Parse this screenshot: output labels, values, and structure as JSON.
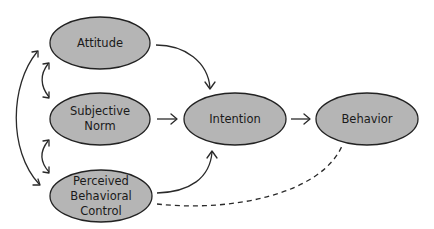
{
  "diagram": {
    "colors": {
      "node_fill": "#b5b5b5",
      "node_stroke": "#222222",
      "edge": "#2a2a2a",
      "background": "#ffffff"
    },
    "nodes": {
      "attitude": {
        "lines": [
          "Attitude"
        ]
      },
      "subjective_norm": {
        "lines": [
          "Subjective",
          "Norm"
        ]
      },
      "pbc": {
        "lines": [
          "Perceived",
          "Behavioral",
          "Control"
        ]
      },
      "intention": {
        "lines": [
          "Intention"
        ]
      },
      "behavior": {
        "lines": [
          "Behavior"
        ]
      }
    },
    "edges": [
      {
        "from": "Attitude",
        "to": "Intention",
        "style": "solid"
      },
      {
        "from": "Subjective Norm",
        "to": "Intention",
        "style": "solid"
      },
      {
        "from": "Perceived Behavioral Control",
        "to": "Intention",
        "style": "solid"
      },
      {
        "from": "Intention",
        "to": "Behavior",
        "style": "solid"
      },
      {
        "from": "Perceived Behavioral Control",
        "to": "Behavior",
        "style": "dashed"
      },
      {
        "from": "Attitude",
        "to": "Subjective Norm",
        "style": "bidirectional"
      },
      {
        "from": "Subjective Norm",
        "to": "Perceived Behavioral Control",
        "style": "bidirectional"
      },
      {
        "from": "Attitude",
        "to": "Perceived Behavioral Control",
        "style": "bidirectional"
      }
    ]
  }
}
